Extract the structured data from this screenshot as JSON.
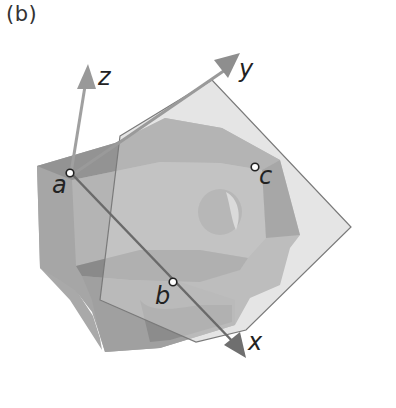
{
  "figure": {
    "panel_label": "(b)",
    "axes": [
      {
        "name": "x",
        "label": "x"
      },
      {
        "name": "y",
        "label": "y"
      },
      {
        "name": "z",
        "label": "z"
      }
    ],
    "points": [
      {
        "name": "a",
        "label": "a"
      },
      {
        "name": "b",
        "label": "b"
      },
      {
        "name": "c",
        "label": "c"
      }
    ],
    "colors": {
      "plane": "#c9c9c9",
      "block_light": "#b0b0b0",
      "block_mid": "#a3a3a3",
      "block_dark": "#8e8e8e",
      "axis": "#9a9a9a",
      "axis_dark": "#6a6a6a"
    }
  }
}
